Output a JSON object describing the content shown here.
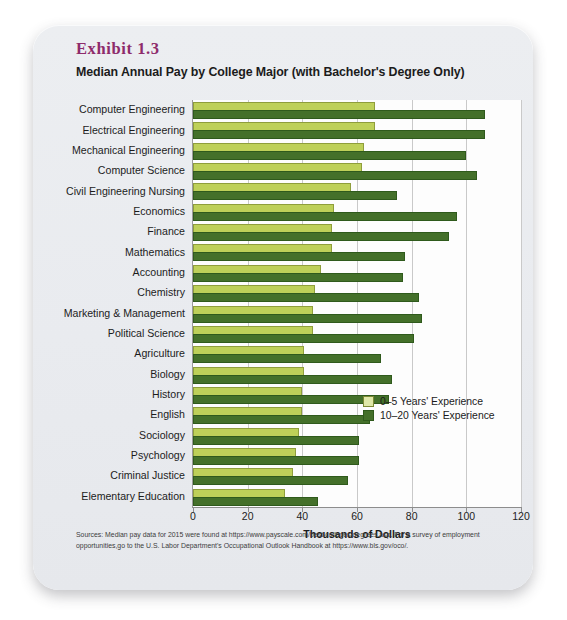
{
  "exhibit": {
    "number": "Exhibit 1.3",
    "title": "Median Annual Pay by College Major (with Bachelor's Degree Only)"
  },
  "legend": {
    "series_0_label": "0–5 Years' Experience",
    "series_1_label": "10–20 Years' Experience",
    "series_0_color": "#bed059",
    "series_1_color": "#44702a",
    "position": "inside-bottom-right"
  },
  "source_note": "Sources: Median pay data for 2015 were found at https://www.payscale.com/best-colleges/degrees.asp. For a survey of employment opportunities,go to the U.S. Labor Department's Occupational Outlook Handbook at https://www.bls.gov/oco/.",
  "chart_data": {
    "type": "bar",
    "orientation": "horizontal",
    "title": "Median Annual Pay by College Major (with Bachelor's Degree Only)",
    "xlabel": "Thousands of Dollars",
    "ylabel": "",
    "xlim": [
      0,
      120
    ],
    "xticks": [
      0,
      20,
      40,
      60,
      80,
      100,
      120
    ],
    "grid": "vertical",
    "categories": [
      "Computer Engineering",
      "Electrical Engineering",
      "Mechanical Engineering",
      "Computer Science",
      "Civil Engineering Nursing",
      "Economics",
      "Finance",
      "Mathematics",
      "Accounting",
      "Chemistry",
      "Marketing & Management",
      "Political Science",
      "Agriculture",
      "Biology",
      "History",
      "English",
      "Sociology",
      "Psychology",
      "Criminal Justice",
      "Elementary Education"
    ],
    "series": [
      {
        "name": "0–5 Years' Experience",
        "color": "#bed059",
        "values": [
          66,
          66,
          62,
          61,
          57,
          51,
          50,
          50,
          46,
          44,
          43,
          43,
          40,
          40,
          39,
          39,
          38,
          37,
          36,
          33
        ]
      },
      {
        "name": "10–20 Years' Experience",
        "color": "#44702a",
        "values": [
          106,
          106,
          99,
          103,
          74,
          96,
          93,
          77,
          76,
          82,
          83,
          80,
          68,
          72,
          71,
          64,
          60,
          60,
          56,
          45
        ]
      }
    ]
  }
}
